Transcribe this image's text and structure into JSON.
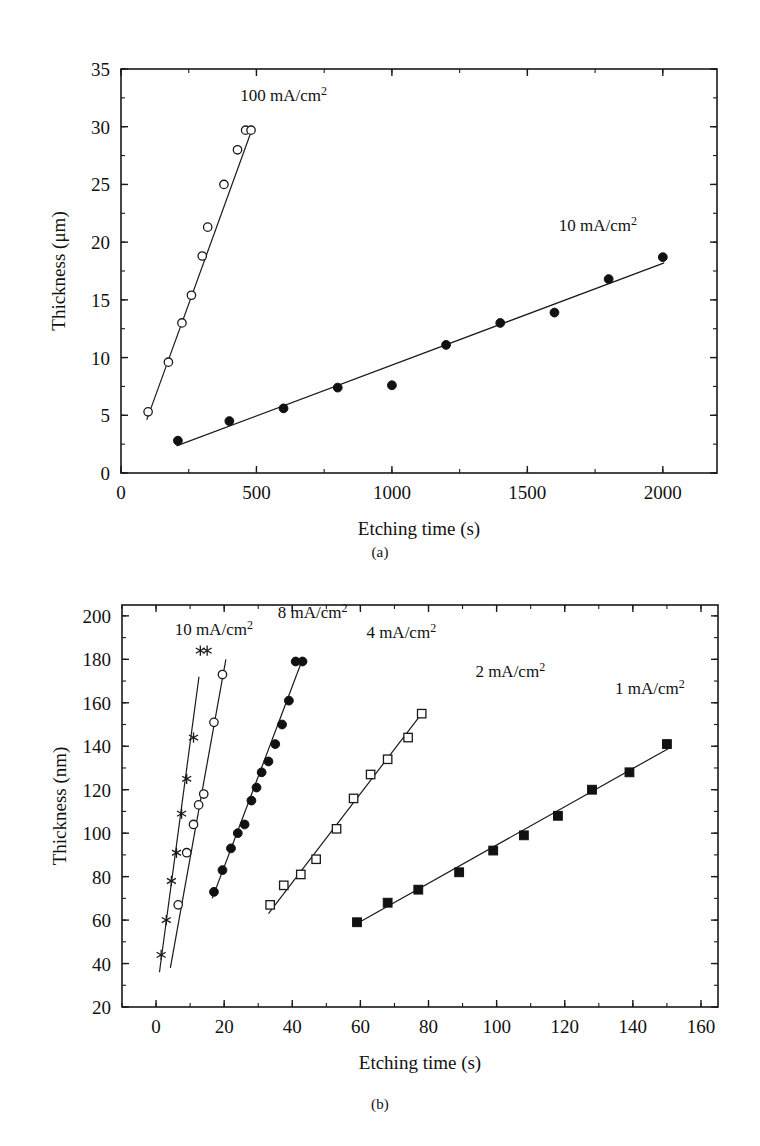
{
  "figure": {
    "panel_a_caption": "(a)",
    "panel_b_caption": "(b)"
  },
  "chart_data": [
    {
      "id": "panel-a",
      "type": "scatter",
      "title": "",
      "xlabel": "Etching time (s)",
      "ylabel": "Thickness (μm)",
      "xlim": [
        0,
        2200
      ],
      "ylim": [
        0,
        35
      ],
      "xticks": [
        0,
        500,
        1000,
        1500,
        2000
      ],
      "xtick_labels": [
        "0",
        "500",
        "1000",
        "1500",
        "2000"
      ],
      "yticks": [
        0,
        5,
        10,
        15,
        20,
        25,
        30,
        35
      ],
      "ytick_labels": [
        "0",
        "5",
        "10",
        "15",
        "20",
        "25",
        "30",
        "35"
      ],
      "x_minor_step": 250,
      "y_minor_step": 2.5,
      "grid": false,
      "legend_position": "inline-annotation",
      "series": [
        {
          "name": "100 mA/cm2",
          "label_text": "100 mA/cm",
          "label_sup": "2",
          "label_x": 600,
          "label_y": 32.2,
          "marker": "open-circle",
          "x": [
            100,
            175,
            225,
            260,
            300,
            320,
            380,
            430,
            460,
            480
          ],
          "y": [
            5.3,
            9.6,
            13.0,
            15.4,
            18.8,
            21.3,
            25.0,
            28.0,
            29.7,
            29.7
          ],
          "fit": {
            "x1": 95,
            "y1": 4.6,
            "x2": 487,
            "y2": 30.0
          }
        },
        {
          "name": "10 mA/cm2",
          "label_text": "10 mA/cm",
          "label_sup": "2",
          "label_x": 1760,
          "label_y": 21.0,
          "marker": "filled-circle",
          "x": [
            210,
            400,
            600,
            800,
            1000,
            1200,
            1400,
            1600,
            1800,
            2000
          ],
          "y": [
            2.8,
            4.5,
            5.6,
            7.4,
            7.6,
            11.1,
            13.0,
            13.9,
            16.8,
            18.7
          ],
          "fit": {
            "x1": 205,
            "y1": 2.35,
            "x2": 2005,
            "y2": 18.2
          }
        }
      ]
    },
    {
      "id": "panel-b",
      "type": "scatter",
      "title": "",
      "xlabel": "Etching time (s)",
      "ylabel": "Thickness (nm)",
      "xlim": [
        -10,
        165
      ],
      "ylim": [
        20,
        205
      ],
      "xticks": [
        0,
        20,
        40,
        60,
        80,
        100,
        120,
        140,
        160
      ],
      "xtick_labels": [
        "0",
        "20",
        "40",
        "60",
        "80",
        "100",
        "120",
        "140",
        "160"
      ],
      "yticks": [
        20,
        40,
        60,
        80,
        100,
        120,
        140,
        160,
        180,
        200
      ],
      "ytick_labels": [
        "20",
        "40",
        "60",
        "80",
        "100",
        "120",
        "140",
        "160",
        "180",
        "200"
      ],
      "x_minor_step": 10,
      "y_minor_step": 10,
      "grid": false,
      "legend_position": "inline-annotation",
      "series": [
        {
          "name": "10 mA/cm2",
          "label_text": "10 mA/cm",
          "label_sup": "2",
          "label_x": 17,
          "label_y": 191,
          "marker": "star",
          "x": [
            1.5,
            3.0,
            4.5,
            6.0,
            7.5,
            9.0,
            11.0,
            13.0,
            15.0
          ],
          "y": [
            44,
            60,
            78,
            91,
            109,
            125,
            144,
            184,
            184
          ],
          "fit": {
            "x1": 1.0,
            "y1": 36,
            "x2": 12.6,
            "y2": 172
          }
        },
        {
          "name": "8 mA/cm2",
          "label_text": "8 mA/cm",
          "label_sup": "2",
          "label_x": 46,
          "label_y": 199,
          "marker": "open-circle",
          "x": [
            6.5,
            9.0,
            11.0,
            12.5,
            14.0,
            17.0,
            19.5
          ],
          "y": [
            67,
            91,
            104,
            113,
            118,
            151,
            173
          ],
          "fit": {
            "x1": 4.2,
            "y1": 38,
            "x2": 20.5,
            "y2": 180
          }
        },
        {
          "name": "4 mA/cm2",
          "label_text": "4 mA/cm",
          "label_sup": "2",
          "label_x": 72,
          "label_y": 190,
          "marker": "filled-circle",
          "x": [
            17,
            19.5,
            22,
            24,
            26,
            28,
            29.5,
            31,
            33,
            35,
            37,
            39,
            41,
            43
          ],
          "y": [
            73,
            83,
            93,
            100,
            104,
            115,
            121,
            128,
            133,
            141,
            150,
            161,
            179,
            179
          ],
          "fit": {
            "x1": 16.5,
            "y1": 70,
            "x2": 43.0,
            "y2": 180
          }
        },
        {
          "name": "2 mA/cm2",
          "label_text": "2 mA/cm",
          "label_sup": "2",
          "label_x": 104,
          "label_y": 172,
          "marker": "open-square",
          "x": [
            33.5,
            37.5,
            42.5,
            47,
            53,
            58,
            63,
            68,
            74,
            78
          ],
          "y": [
            67,
            76,
            81,
            88,
            102,
            116,
            127,
            134,
            144,
            155
          ],
          "fit": {
            "x1": 33,
            "y1": 63,
            "x2": 78.5,
            "y2": 156
          }
        },
        {
          "name": "1 mA/cm2",
          "label_text": "1 mA/cm",
          "label_sup": "2",
          "label_x": 145,
          "label_y": 164,
          "marker": "filled-square",
          "x": [
            59,
            68,
            77,
            89,
            99,
            108,
            118,
            128,
            139,
            150
          ],
          "y": [
            59,
            68,
            74,
            82,
            92,
            99,
            108,
            120,
            128,
            141
          ],
          "fit": {
            "x1": 58.5,
            "y1": 58,
            "x2": 150.5,
            "y2": 139
          }
        }
      ]
    }
  ]
}
